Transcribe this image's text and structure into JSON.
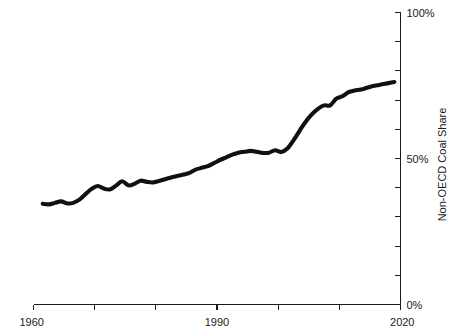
{
  "chart_data": {
    "type": "line",
    "title": "",
    "subtitle": "",
    "xlabel": "",
    "ylabel": "Non-OECD Coal Share",
    "xlim": [
      1960,
      2020
    ],
    "ylim": [
      0,
      100
    ],
    "grid": false,
    "legend": false,
    "legend_position": "none",
    "y_axis_side": "right",
    "x_tick_values": [
      1960,
      1970,
      1980,
      1990,
      2000,
      2010,
      2020
    ],
    "x_tick_labels": [
      "1960",
      "",
      "",
      "1990",
      "",
      "",
      "2020"
    ],
    "y_tick_values": [
      0,
      10,
      20,
      30,
      40,
      50,
      60,
      70,
      80,
      90,
      100
    ],
    "y_tick_labels": [
      "0%",
      "",
      "",
      "",
      "",
      "50%",
      "",
      "",
      "",
      "",
      "100%"
    ],
    "series": [
      {
        "name": "Non-OECD Coal Share",
        "color": "#111111",
        "line_width": 4,
        "x": [
          1961.5,
          1962.5,
          1963.5,
          1964.5,
          1965.5,
          1966.5,
          1967.5,
          1968.5,
          1969.5,
          1970.5,
          1971.5,
          1972.5,
          1973.5,
          1974.5,
          1975.5,
          1976.5,
          1977.5,
          1978.5,
          1979.5,
          1980.5,
          1981.5,
          1982.5,
          1983.5,
          1984.5,
          1985.5,
          1986.5,
          1987.5,
          1988.5,
          1989.5,
          1990.5,
          1991.5,
          1992.5,
          1993.5,
          1994.5,
          1995.5,
          1996.5,
          1997.5,
          1998.5,
          1999.5,
          2000.5,
          2001.5,
          2002.5,
          2003.5,
          2004.5,
          2005.5,
          2006.5,
          2007.5,
          2008.5,
          2009.5,
          2010.5,
          2011.5,
          2012.5,
          2013.5,
          2014.5,
          2015.5,
          2016.5,
          2017.5,
          2018.5,
          2019.0
        ],
        "y": [
          34.5,
          34.3,
          34.8,
          35.3,
          34.6,
          34.8,
          35.9,
          37.8,
          39.6,
          40.6,
          39.7,
          39.4,
          40.7,
          42.2,
          40.8,
          41.3,
          42.4,
          42.0,
          41.8,
          42.3,
          42.9,
          43.5,
          44.0,
          44.5,
          45.1,
          46.2,
          46.8,
          47.4,
          48.4,
          49.5,
          50.4,
          51.3,
          52.0,
          52.3,
          52.6,
          52.3,
          51.9,
          52.0,
          52.8,
          52.2,
          53.4,
          56.2,
          59.5,
          62.6,
          65.1,
          67.0,
          68.2,
          68.2,
          70.5,
          71.3,
          72.7,
          73.3,
          73.6,
          74.2,
          74.8,
          75.2,
          75.6,
          76.0,
          76.2
        ]
      }
    ]
  },
  "axes": {
    "y_label": "Non-OECD Coal Share",
    "y_ticks": [
      {
        "value": 100,
        "label": "100%"
      },
      {
        "value": 90,
        "label": ""
      },
      {
        "value": 80,
        "label": ""
      },
      {
        "value": 70,
        "label": ""
      },
      {
        "value": 60,
        "label": ""
      },
      {
        "value": 50,
        "label": "50%"
      },
      {
        "value": 40,
        "label": ""
      },
      {
        "value": 30,
        "label": ""
      },
      {
        "value": 20,
        "label": ""
      },
      {
        "value": 10,
        "label": ""
      },
      {
        "value": 0,
        "label": "0%"
      }
    ],
    "x_ticks": [
      {
        "value": 1960,
        "label": "1960"
      },
      {
        "value": 1970,
        "label": ""
      },
      {
        "value": 1980,
        "label": ""
      },
      {
        "value": 1990,
        "label": "1990"
      },
      {
        "value": 2000,
        "label": ""
      },
      {
        "value": 2010,
        "label": ""
      },
      {
        "value": 2020,
        "label": "2020"
      }
    ]
  }
}
